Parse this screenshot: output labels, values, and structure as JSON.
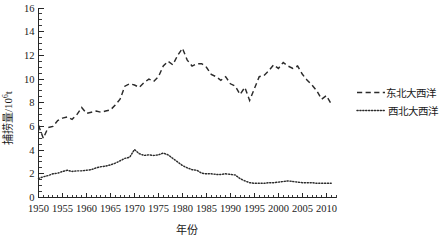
{
  "chart_data": {
    "type": "line",
    "title": "",
    "xlabel": "年份",
    "ylabel": "捕捞量/10",
    "ylabel_sup": "6",
    "ylabel_unit": "t",
    "xlim": [
      1950,
      2012
    ],
    "ylim": [
      0,
      16
    ],
    "ytick_values": [
      0,
      2,
      4,
      6,
      8,
      10,
      12,
      14,
      16
    ],
    "ytick_labels": [
      "0",
      "2",
      "4",
      "6",
      "8",
      "10",
      "12",
      "14",
      "16"
    ],
    "y_minor_step": 0.5,
    "xtick_values": [
      1950,
      1955,
      1960,
      1965,
      1970,
      1975,
      1980,
      1985,
      1990,
      1995,
      2000,
      2005,
      2010
    ],
    "xtick_labels": [
      "1950",
      "1955",
      "1960",
      "1965",
      "1970",
      "1975",
      "1980",
      "1985",
      "1990",
      "1995",
      "2000",
      "2005",
      "2010"
    ],
    "x_minor_step": 1,
    "grid": false,
    "legend_position": "right",
    "x": [
      1950,
      1951,
      1952,
      1953,
      1954,
      1955,
      1956,
      1957,
      1958,
      1959,
      1960,
      1961,
      1962,
      1963,
      1964,
      1965,
      1966,
      1967,
      1968,
      1969,
      1970,
      1971,
      1972,
      1973,
      1974,
      1975,
      1976,
      1977,
      1978,
      1979,
      1980,
      1981,
      1982,
      1983,
      1984,
      1985,
      1986,
      1987,
      1988,
      1989,
      1990,
      1991,
      1992,
      1993,
      1994,
      1995,
      1996,
      1997,
      1998,
      1999,
      2000,
      2001,
      2002,
      2003,
      2004,
      2005,
      2006,
      2007,
      2008,
      2009,
      2010,
      2011
    ],
    "series": [
      {
        "name": "东北大西洋",
        "style": "dashed",
        "color": "#2b2b2b",
        "values": [
          6.1,
          5.0,
          5.9,
          6.0,
          6.5,
          6.7,
          6.8,
          6.6,
          7.0,
          7.6,
          7.1,
          7.2,
          7.3,
          7.2,
          7.3,
          7.4,
          7.8,
          8.3,
          9.4,
          9.6,
          9.5,
          9.3,
          9.7,
          10.0,
          9.8,
          10.2,
          11.1,
          11.5,
          11.2,
          12.0,
          12.6,
          11.6,
          11.1,
          11.3,
          11.3,
          11.0,
          10.4,
          10.2,
          9.9,
          10.2,
          9.6,
          9.4,
          8.7,
          9.3,
          8.2,
          9.2,
          10.2,
          10.3,
          10.7,
          11.2,
          10.9,
          11.4,
          11.1,
          10.9,
          11.1,
          10.4,
          9.9,
          9.5,
          9.0,
          8.3,
          8.6,
          7.9
        ]
      },
      {
        "name": "西北大西洋",
        "style": "dotted",
        "color": "#2b2b2b",
        "values": [
          1.6,
          1.75,
          1.85,
          2.0,
          2.05,
          2.2,
          2.3,
          2.2,
          2.25,
          2.25,
          2.3,
          2.35,
          2.5,
          2.6,
          2.65,
          2.75,
          2.9,
          3.1,
          3.3,
          3.4,
          4.05,
          3.7,
          3.55,
          3.6,
          3.55,
          3.6,
          3.75,
          3.6,
          3.3,
          3.0,
          2.7,
          2.5,
          2.35,
          2.3,
          2.05,
          2.0,
          2.0,
          1.95,
          1.95,
          2.0,
          1.95,
          1.9,
          1.6,
          1.4,
          1.25,
          1.2,
          1.2,
          1.2,
          1.25,
          1.25,
          1.3,
          1.35,
          1.4,
          1.35,
          1.3,
          1.25,
          1.25,
          1.25,
          1.2,
          1.2,
          1.2,
          1.2
        ]
      }
    ]
  },
  "legend": {
    "items": [
      {
        "label": "东北大西洋",
        "style": "dashed"
      },
      {
        "label": "西北大西洋",
        "style": "dotted"
      }
    ]
  }
}
